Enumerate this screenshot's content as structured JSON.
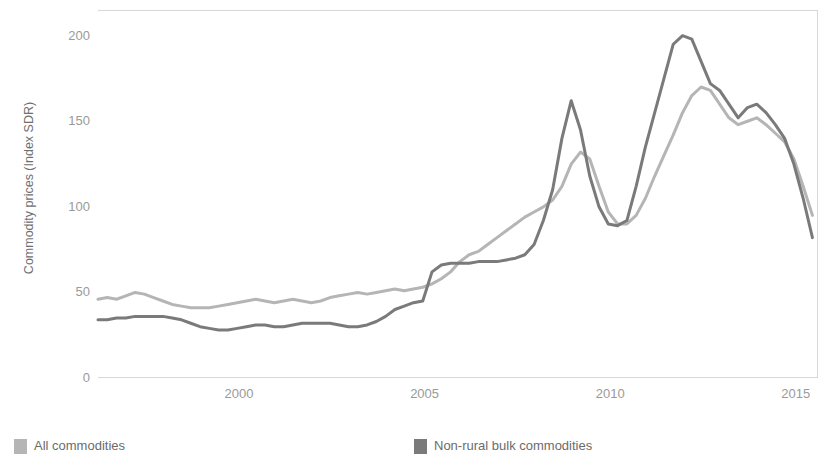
{
  "chart_data": {
    "type": "line",
    "title": "",
    "xlabel": "",
    "ylabel": "Commodity prices (Index SDR)",
    "xlim": [
      1996.2,
      2015.6
    ],
    "ylim": [
      0,
      215
    ],
    "yticks": [
      0,
      50,
      100,
      150,
      200
    ],
    "ytick_labels": [
      "0",
      "50",
      "100",
      "150",
      "200"
    ],
    "xticks": [
      2000,
      2005,
      2010,
      2015
    ],
    "xtick_labels": [
      "2000",
      "2005",
      "2010",
      "2015"
    ],
    "grid": false,
    "legend_position": "below",
    "colors": {
      "all_commodities": "#b5b5b5",
      "non_rural_bulk": "#7a7a7a",
      "axis": "#d8d8d8",
      "tick_text": "#9a9a9a",
      "axis_title": "#6f6f6f",
      "legend_text": "#6b6b6b",
      "background": "#ffffff"
    },
    "series": [
      {
        "name": "All commodities",
        "color": "#b5b5b5",
        "x": [
          1996.2,
          1996.45,
          1996.7,
          1996.95,
          1997.2,
          1997.45,
          1997.7,
          1997.95,
          1998.2,
          1998.45,
          1998.7,
          1998.95,
          1999.2,
          1999.45,
          1999.7,
          1999.95,
          2000.2,
          2000.45,
          2000.7,
          2000.95,
          2001.2,
          2001.45,
          2001.7,
          2001.95,
          2002.2,
          2002.45,
          2002.7,
          2002.95,
          2003.2,
          2003.45,
          2003.7,
          2003.95,
          2004.2,
          2004.45,
          2004.7,
          2004.95,
          2005.2,
          2005.45,
          2005.7,
          2005.95,
          2006.2,
          2006.45,
          2006.7,
          2006.95,
          2007.2,
          2007.45,
          2007.7,
          2007.95,
          2008.2,
          2008.45,
          2008.7,
          2008.95,
          2009.2,
          2009.45,
          2009.7,
          2009.95,
          2010.2,
          2010.45,
          2010.7,
          2010.95,
          2011.2,
          2011.45,
          2011.7,
          2011.95,
          2012.2,
          2012.45,
          2012.7,
          2012.95,
          2013.2,
          2013.45,
          2013.7,
          2013.95,
          2014.2,
          2014.45,
          2014.7,
          2014.95,
          2015.2,
          2015.45
        ],
        "values": [
          46,
          47,
          46,
          48,
          50,
          49,
          47,
          45,
          43,
          42,
          41,
          41,
          41,
          42,
          43,
          44,
          45,
          46,
          45,
          44,
          45,
          46,
          45,
          44,
          45,
          47,
          48,
          49,
          50,
          49,
          50,
          51,
          52,
          51,
          52,
          53,
          55,
          58,
          62,
          68,
          72,
          74,
          78,
          82,
          86,
          90,
          94,
          97,
          100,
          104,
          112,
          125,
          132,
          128,
          112,
          97,
          90,
          90,
          95,
          105,
          118,
          130,
          142,
          155,
          165,
          170,
          168,
          160,
          152,
          148,
          150,
          152,
          148,
          143,
          138,
          128,
          112,
          95
        ],
        "endpoints": {
          "start_value": 46,
          "end_value": 88
        },
        "peak_2008": 132,
        "trough_2009": 90,
        "peak_2011": 170
      },
      {
        "name": "Non-rural bulk commodities",
        "color": "#7a7a7a",
        "x": [
          1996.2,
          1996.45,
          1996.7,
          1996.95,
          1997.2,
          1997.45,
          1997.7,
          1997.95,
          1998.2,
          1998.45,
          1998.7,
          1998.95,
          1999.2,
          1999.45,
          1999.7,
          1999.95,
          2000.2,
          2000.45,
          2000.7,
          2000.95,
          2001.2,
          2001.45,
          2001.7,
          2001.95,
          2002.2,
          2002.45,
          2002.7,
          2002.95,
          2003.2,
          2003.45,
          2003.7,
          2003.95,
          2004.2,
          2004.45,
          2004.7,
          2004.95,
          2005.2,
          2005.45,
          2005.7,
          2005.95,
          2006.2,
          2006.45,
          2006.7,
          2006.95,
          2007.2,
          2007.45,
          2007.7,
          2007.95,
          2008.2,
          2008.45,
          2008.7,
          2008.95,
          2009.2,
          2009.45,
          2009.7,
          2009.95,
          2010.2,
          2010.45,
          2010.7,
          2010.95,
          2011.2,
          2011.45,
          2011.7,
          2011.95,
          2012.2,
          2012.45,
          2012.7,
          2012.95,
          2013.2,
          2013.45,
          2013.7,
          2013.95,
          2014.2,
          2014.45,
          2014.7,
          2014.95,
          2015.2,
          2015.45
        ],
        "values": [
          34,
          34,
          35,
          35,
          36,
          36,
          36,
          36,
          35,
          34,
          32,
          30,
          29,
          28,
          28,
          29,
          30,
          31,
          31,
          30,
          30,
          31,
          32,
          32,
          32,
          32,
          31,
          30,
          30,
          31,
          33,
          36,
          40,
          42,
          44,
          45,
          62,
          66,
          67,
          67,
          67,
          68,
          68,
          68,
          69,
          70,
          72,
          78,
          92,
          110,
          140,
          162,
          145,
          118,
          100,
          90,
          89,
          92,
          112,
          135,
          155,
          175,
          195,
          200,
          198,
          185,
          172,
          168,
          160,
          152,
          158,
          160,
          155,
          148,
          140,
          125,
          105,
          82
        ],
        "endpoints": {
          "start_value": 34,
          "end_value": 76
        },
        "peak_2008": 162,
        "trough_2009": 89,
        "peak_2011": 200
      }
    ]
  },
  "legend": {
    "items": [
      {
        "label": "All commodities",
        "color": "#b5b5b5"
      },
      {
        "label": "Non-rural bulk commodities",
        "color": "#7a7a7a"
      }
    ]
  }
}
